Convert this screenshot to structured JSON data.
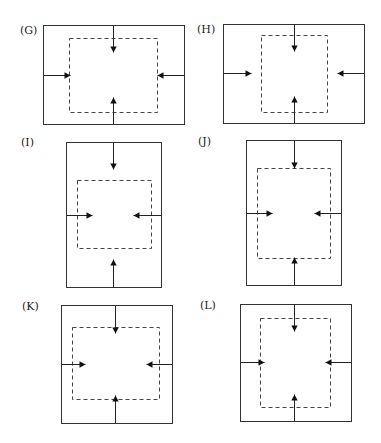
{
  "figure": {
    "line_color": "#333333",
    "background": "#ffffff",
    "panels": [
      {
        "id": "G",
        "label": "(G)",
        "label_pos": [
          20,
          34
        ],
        "outer": [
          43,
          25,
          184,
          124
        ],
        "dashed": [
          69,
          38,
          157,
          112
        ],
        "arrows": {
          "top": [
            113,
            25,
            113,
            52
          ],
          "left": [
            43,
            75,
            70,
            75
          ],
          "right": [
            184,
            75,
            157,
            75
          ],
          "bottom": [
            113,
            124,
            113,
            97
          ]
        }
      },
      {
        "id": "H",
        "label": "(H)",
        "label_pos": [
          197,
          33
        ],
        "outer": [
          223,
          24,
          364,
          123
        ],
        "dashed": [
          261,
          35,
          327,
          112
        ],
        "arrows": {
          "top": [
            294,
            24,
            294,
            51
          ],
          "left": [
            223,
            73,
            251,
            73
          ],
          "right": [
            364,
            73,
            337,
            73
          ],
          "bottom": [
            294,
            123,
            294,
            96
          ]
        }
      },
      {
        "id": "I",
        "label": "(I)",
        "label_pos": [
          21,
          146
        ],
        "outer": [
          66,
          142,
          161,
          287
        ],
        "dashed": [
          77,
          180,
          151,
          248
        ],
        "arrows": {
          "top": [
            113,
            142,
            113,
            169
          ],
          "left": [
            66,
            215,
            92,
            215
          ],
          "right": [
            161,
            215,
            133,
            215
          ],
          "bottom": [
            113,
            287,
            113,
            259
          ]
        }
      },
      {
        "id": "J",
        "label": "(J)",
        "label_pos": [
          198,
          145
        ],
        "outer": [
          246,
          140,
          341,
          285
        ],
        "dashed": [
          257,
          168,
          330,
          258
        ],
        "arrows": {
          "top": [
            294,
            140,
            294,
            168
          ],
          "left": [
            246,
            213,
            272,
            213
          ],
          "right": [
            341,
            213,
            314,
            213
          ],
          "bottom": [
            294,
            285,
            294,
            257
          ]
        }
      },
      {
        "id": "K",
        "label": "(K)",
        "label_pos": [
          22,
          310
        ],
        "outer": [
          61,
          305,
          172,
          423
        ],
        "dashed": [
          72,
          327,
          159,
          399
        ],
        "arrows": {
          "top": [
            115,
            305,
            115,
            333
          ],
          "left": [
            61,
            364,
            85,
            364
          ],
          "right": [
            172,
            364,
            146,
            364
          ],
          "bottom": [
            115,
            423,
            115,
            395
          ]
        }
      },
      {
        "id": "L",
        "label": "(L)",
        "label_pos": [
          200,
          309
        ],
        "outer": [
          240,
          304,
          351,
          421
        ],
        "dashed": [
          260,
          318,
          330,
          407
        ],
        "arrows": {
          "top": [
            294,
            304,
            294,
            331
          ],
          "left": [
            240,
            362,
            264,
            362
          ],
          "right": [
            351,
            362,
            325,
            362
          ],
          "bottom": [
            294,
            421,
            294,
            394
          ]
        }
      }
    ]
  }
}
